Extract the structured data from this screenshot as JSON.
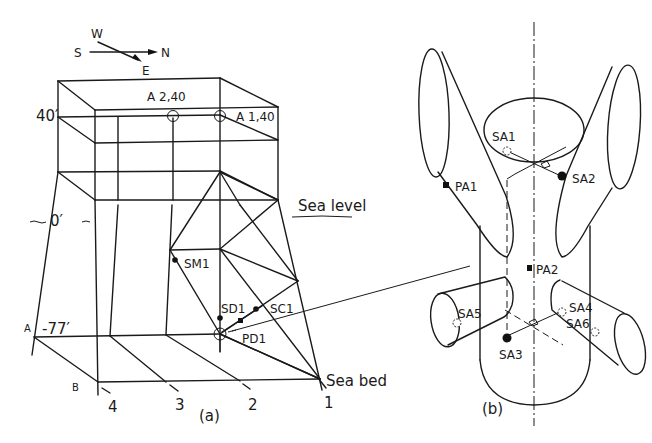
{
  "figure": {
    "compass": {
      "north": "N",
      "south": "S",
      "east": "E",
      "west": "W"
    },
    "panel_a": {
      "caption": "(a)",
      "elevations": {
        "top": "40′",
        "sea_level": "0′",
        "bed": "-77′"
      },
      "annotations": {
        "sea_level": "Sea level",
        "sea_bed": "Sea bed"
      },
      "row_labels": {
        "a": "A",
        "b": "B"
      },
      "leg_numbers": [
        "4",
        "3",
        "2",
        "1"
      ],
      "sensors": {
        "a2": "A 2,40",
        "a1": "A 1,40",
        "sm1": "SM1",
        "sd1": "SD1",
        "sc1": "SC1",
        "pd1": "PD1"
      }
    },
    "panel_b": {
      "caption": "(b)",
      "sensors": {
        "sa1": "SA1",
        "sa2": "SA2",
        "sa3": "SA3",
        "sa4": "SA4",
        "sa5": "SA5",
        "sa6": "SA6",
        "pa1": "PA1",
        "pa2": "PA2"
      }
    }
  }
}
